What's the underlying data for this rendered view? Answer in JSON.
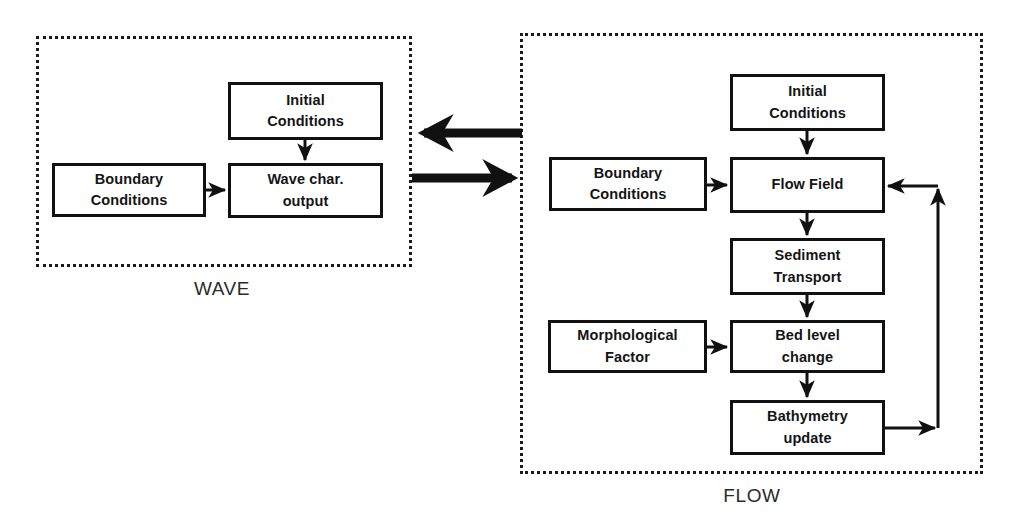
{
  "figure": {
    "type": "flow-diagram",
    "background": "#ffffff",
    "line_color": "#111111",
    "panel_border_color": "#1a1a1a",
    "label_color": "#2b2b2b"
  },
  "panels": [
    {
      "id": "wave",
      "label": "WAVE",
      "nodes": [
        {
          "id": "wave-initial-conditions",
          "line1": "Initial",
          "line2": "Conditions"
        },
        {
          "id": "wave-boundary-conditions",
          "line1": "Boundary",
          "line2": "Conditions"
        },
        {
          "id": "wave-char-output",
          "line1": "Wave char.",
          "line2": "output"
        }
      ]
    },
    {
      "id": "flow",
      "label": "FLOW",
      "nodes": [
        {
          "id": "flow-initial-conditions",
          "line1": "Initial",
          "line2": "Conditions"
        },
        {
          "id": "flow-boundary-conditions",
          "line1": "Boundary",
          "line2": "Conditions"
        },
        {
          "id": "flow-field",
          "line1": "Flow Field",
          "line2": ""
        },
        {
          "id": "flow-sediment-transport",
          "line1": "Sediment",
          "line2": "Transport"
        },
        {
          "id": "flow-morphological-factor",
          "line1": "Morphological",
          "line2": "Factor"
        },
        {
          "id": "flow-bed-level-change",
          "line1": "Bed level",
          "line2": "change"
        },
        {
          "id": "flow-bathymetry-update",
          "line1": "Bathymetry",
          "line2": "update"
        }
      ]
    }
  ],
  "connectors": {
    "wave_internal": [
      {
        "name": "initial-to-wave-output",
        "direction": "down"
      },
      {
        "name": "boundary-to-wave-output",
        "direction": "right"
      }
    ],
    "flow_internal": [
      {
        "name": "initial-to-flow-field",
        "direction": "down"
      },
      {
        "name": "boundary-to-flow-field",
        "direction": "right"
      },
      {
        "name": "flow-field-to-sediment-transport",
        "direction": "down"
      },
      {
        "name": "sediment-transport-to-bed-level-change",
        "direction": "down"
      },
      {
        "name": "morphological-factor-to-bed-level-change",
        "direction": "right"
      },
      {
        "name": "bed-level-change-to-bathymetry-update",
        "direction": "down"
      },
      {
        "name": "bathymetry-update-feedback-to-flow-field",
        "direction": "loop"
      }
    ],
    "coupling": [
      {
        "name": "flow-to-wave-arrow",
        "direction": "left",
        "style": "thick"
      },
      {
        "name": "wave-to-flow-arrow",
        "direction": "right",
        "style": "thick"
      }
    ]
  }
}
